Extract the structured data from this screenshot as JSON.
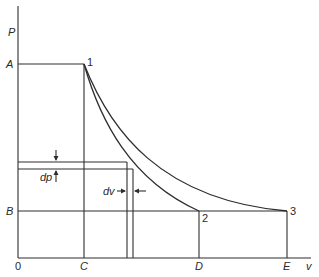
{
  "diagram": {
    "type": "pressure-volume diagram",
    "axes": {
      "y_label": "P",
      "x_label": "v",
      "origin_label": "0"
    },
    "pressure_levels": [
      {
        "label": "A",
        "description": "high pressure"
      },
      {
        "label": "B",
        "description": "low pressure"
      }
    ],
    "volume_levels": [
      {
        "label": "C"
      },
      {
        "label": "D"
      },
      {
        "label": "E"
      }
    ],
    "points": [
      {
        "label": "1",
        "at": "C, A"
      },
      {
        "label": "2",
        "at": "D, B"
      },
      {
        "label": "3",
        "at": "E, B"
      }
    ],
    "curves": [
      {
        "name": "curve-1-2",
        "from": "1",
        "to": "2",
        "shape": "steeper expansion curve"
      },
      {
        "name": "curve-1-3",
        "from": "1",
        "to": "3",
        "shape": "flatter expansion curve"
      }
    ],
    "increments": {
      "dp_label": "dp",
      "dv_label": "dv"
    },
    "colors": {
      "line": "#2e2e2e",
      "background": "#ffffff"
    }
  }
}
